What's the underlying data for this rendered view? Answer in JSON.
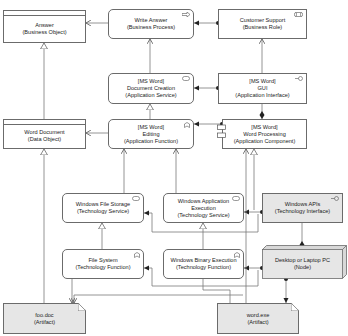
{
  "diagram": {
    "type": "ArchiMate layered view",
    "elements": {
      "answer": {
        "name": "Answer",
        "type": "(Business Object)"
      },
      "write_answer": {
        "name": "Write Answer",
        "type": "(Business Process)"
      },
      "customer_support": {
        "name": "Customer Support",
        "type": "(Business Role)"
      },
      "word_document": {
        "name": "Word Document",
        "type": "(Data Object)"
      },
      "document_creation": {
        "prefix": "[MS Word]",
        "name": "Document Creation",
        "type": "(Application Service)"
      },
      "gui": {
        "prefix": "[MS Word]",
        "name": "GUI",
        "type": "(Application Interface)"
      },
      "editing": {
        "prefix": "[MS Word]",
        "name": "Editing",
        "type": "(Application Function)"
      },
      "word_processing": {
        "prefix": "[MS Word]",
        "name": "Word Processing",
        "type": "(Application Component)"
      },
      "windows_file_storage": {
        "name": "Windows File Storage",
        "type": "(Technology Service)"
      },
      "windows_app_execution": {
        "name1": "Windows Application",
        "name2": "Execution",
        "type": "(Technology Service)"
      },
      "windows_apis": {
        "name": "Windows APIs",
        "type": "(Technology Interface)"
      },
      "file_system": {
        "name": "File System",
        "type": "(Technology Function)"
      },
      "windows_binary_execution": {
        "name": "Windows Binary Execution",
        "type": "(Technology Function)"
      },
      "desktop_pc": {
        "name": "Desktop or Laptop PC",
        "type": "(Node)"
      },
      "foo_doc": {
        "name": "foo.doc",
        "type": "(Artifact)"
      },
      "word_exe": {
        "name": "word.exe",
        "type": "(Artifact)"
      }
    },
    "relationships": [
      {
        "from": "Write Answer",
        "to": "Answer",
        "kind": "access"
      },
      {
        "from": "Customer Support",
        "to": "Write Answer",
        "kind": "assignment"
      },
      {
        "from": "Document Creation",
        "to": "Write Answer",
        "kind": "serving"
      },
      {
        "from": "GUI",
        "to": "Customer Support",
        "kind": "serving"
      },
      {
        "from": "GUI",
        "to": "Document Creation",
        "kind": "assignment"
      },
      {
        "from": "Word Processing",
        "to": "GUI",
        "kind": "composition"
      },
      {
        "from": "Word Document",
        "to": "Answer",
        "kind": "realization"
      },
      {
        "from": "Editing",
        "to": "Word Document",
        "kind": "access"
      },
      {
        "from": "Editing",
        "to": "Document Creation",
        "kind": "realization"
      },
      {
        "from": "Word Processing",
        "to": "Editing",
        "kind": "assignment"
      },
      {
        "from": "foo.doc",
        "to": "Word Document",
        "kind": "realization"
      },
      {
        "from": "Windows File Storage",
        "to": "Editing",
        "kind": "serving"
      },
      {
        "from": "Windows Application Execution",
        "to": "Editing",
        "kind": "serving"
      },
      {
        "from": "Windows Application Execution",
        "to": "Word Processing",
        "kind": "realization"
      },
      {
        "from": "Windows APIs",
        "to": "Windows File Storage",
        "kind": "assignment"
      },
      {
        "from": "Windows APIs",
        "to": "Windows Application Execution",
        "kind": "assignment"
      },
      {
        "from": "File System",
        "to": "Windows File Storage",
        "kind": "realization"
      },
      {
        "from": "Windows Binary Execution",
        "to": "Windows Application Execution",
        "kind": "realization"
      },
      {
        "from": "Desktop or Laptop PC",
        "to": "Windows APIs",
        "kind": "composition"
      },
      {
        "from": "Desktop or Laptop PC",
        "to": "File System",
        "kind": "assignment"
      },
      {
        "from": "Desktop or Laptop PC",
        "to": "Windows Binary Execution",
        "kind": "assignment"
      },
      {
        "from": "Desktop or Laptop PC",
        "to": "word.exe",
        "kind": "assignment"
      },
      {
        "from": "File System",
        "to": "foo.doc",
        "kind": "access"
      },
      {
        "from": "word.exe",
        "to": "Word Processing",
        "kind": "realization"
      }
    ],
    "colors": {
      "border": "#6b6b6b",
      "line": "#7a7a7a",
      "fill_white": "#ffffff",
      "fill_grey": "#e6e6e6"
    }
  }
}
